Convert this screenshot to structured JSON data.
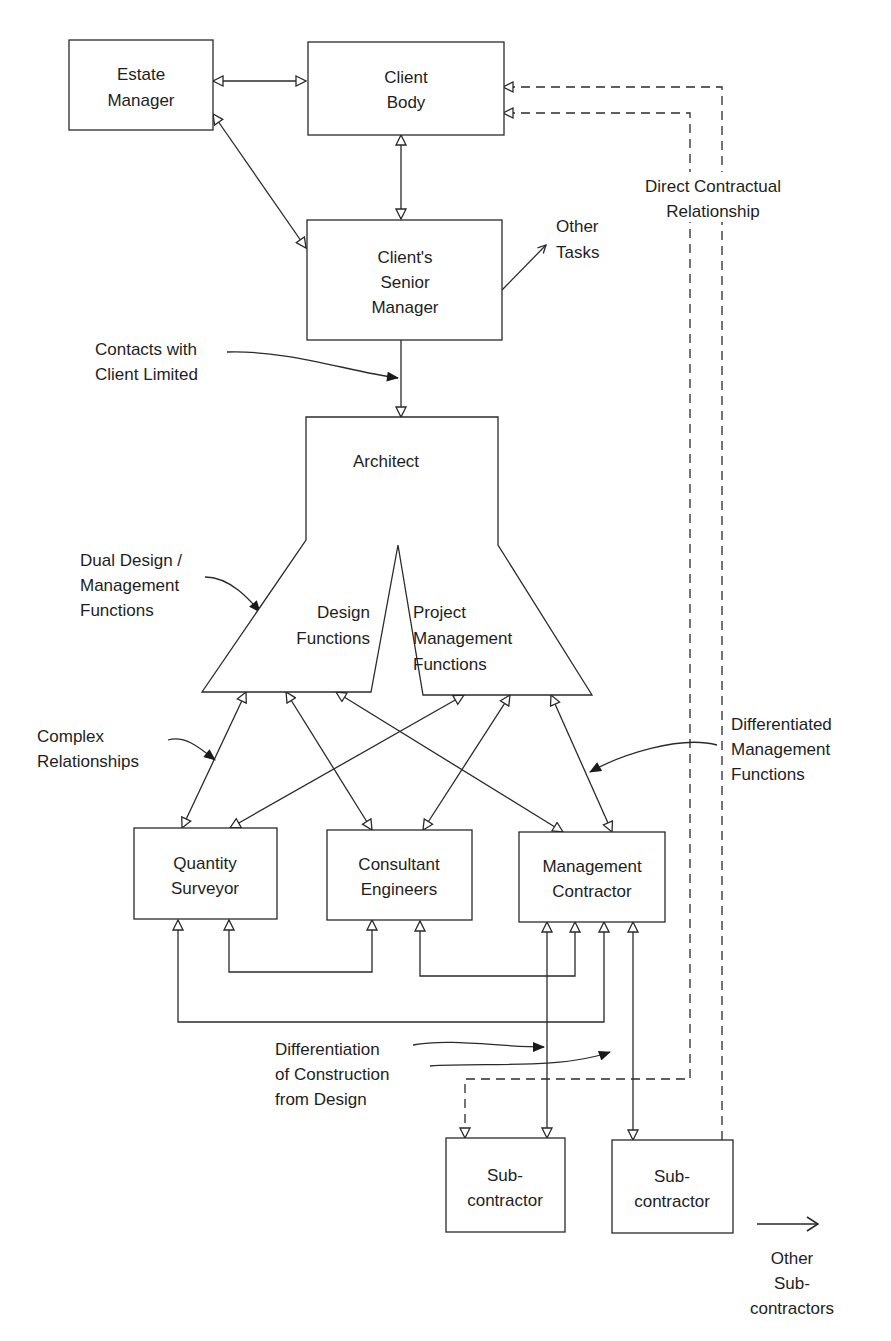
{
  "nodes": {
    "estate_manager": [
      "Estate",
      "Manager"
    ],
    "client_body": [
      "Client",
      "Body"
    ],
    "senior_manager": [
      "Client's",
      "Senior",
      "Manager"
    ],
    "architect": "Architect",
    "design_functions": [
      "Design",
      "Functions"
    ],
    "pm_functions": [
      "Project",
      "Management",
      "Functions"
    ],
    "quantity_surveyor": [
      "Quantity",
      "Surveyor"
    ],
    "consultant_engineers": [
      "Consultant",
      "Engineers"
    ],
    "management_contractor": [
      "Management",
      "Contractor"
    ],
    "subcontractor_1": [
      "Sub-",
      "contractor"
    ],
    "subcontractor_2": [
      "Sub-",
      "contractor"
    ]
  },
  "annotations": {
    "other_tasks": [
      "Other",
      "Tasks"
    ],
    "direct_contractual": [
      "Direct Contractual",
      "Relationship"
    ],
    "contacts_limited": [
      "Contacts with",
      "Client Limited"
    ],
    "dual_design": [
      "Dual Design /",
      "Management",
      "Functions"
    ],
    "complex_relationships": [
      "Complex",
      "Relationships"
    ],
    "differentiated_mgmt": [
      "Differentiated",
      "Management",
      "Functions"
    ],
    "differentiation_construction": [
      "Differentiation",
      "of Construction",
      "from Design"
    ],
    "other_subcontractors": [
      "Other",
      "Sub-",
      "contractors"
    ]
  },
  "colors": {
    "line": "#2a2a2a",
    "text": "#1e1e1e",
    "background": "#ffffff"
  }
}
